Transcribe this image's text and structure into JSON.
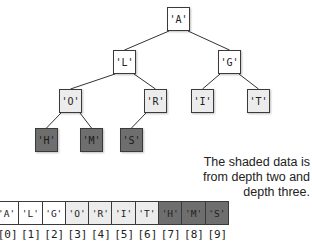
{
  "tree": {
    "nodes": [
      {
        "id": "A",
        "label": "'A'",
        "depth": 0,
        "shade": "light",
        "x": 167,
        "y": 7
      },
      {
        "id": "L",
        "label": "'L'",
        "depth": 1,
        "shade": "light",
        "x": 113,
        "y": 50
      },
      {
        "id": "G",
        "label": "'G'",
        "depth": 1,
        "shade": "light",
        "x": 218,
        "y": 50
      },
      {
        "id": "O",
        "label": "'O'",
        "depth": 2,
        "shade": "mid",
        "x": 59,
        "y": 89
      },
      {
        "id": "R",
        "label": "'R'",
        "depth": 2,
        "shade": "mid",
        "x": 144,
        "y": 89
      },
      {
        "id": "I",
        "label": "'I'",
        "depth": 2,
        "shade": "mid",
        "x": 191,
        "y": 89
      },
      {
        "id": "T",
        "label": "'T'",
        "depth": 2,
        "shade": "mid",
        "x": 247,
        "y": 89
      },
      {
        "id": "H",
        "label": "'H'",
        "depth": 3,
        "shade": "dark",
        "x": 35,
        "y": 128
      },
      {
        "id": "M",
        "label": "'M'",
        "depth": 3,
        "shade": "dark",
        "x": 80,
        "y": 128
      },
      {
        "id": "S",
        "label": "'S'",
        "depth": 3,
        "shade": "dark",
        "x": 120,
        "y": 128
      }
    ],
    "edges": [
      [
        "A",
        "L"
      ],
      [
        "A",
        "G"
      ],
      [
        "L",
        "O"
      ],
      [
        "L",
        "R"
      ],
      [
        "G",
        "I"
      ],
      [
        "G",
        "T"
      ],
      [
        "O",
        "H"
      ],
      [
        "O",
        "M"
      ],
      [
        "R",
        "S"
      ]
    ]
  },
  "note": {
    "text": "The shaded data is from depth two and depth three.",
    "line1": "The shaded data is",
    "line2": "from depth two and",
    "line3": "depth three."
  },
  "array": {
    "cells": [
      {
        "label": "'A'",
        "shade": "light"
      },
      {
        "label": "'L'",
        "shade": "light"
      },
      {
        "label": "'G'",
        "shade": "light"
      },
      {
        "label": "'O'",
        "shade": "mid"
      },
      {
        "label": "'R'",
        "shade": "mid"
      },
      {
        "label": "'I'",
        "shade": "mid"
      },
      {
        "label": "'T'",
        "shade": "mid"
      },
      {
        "label": "'H'",
        "shade": "dark"
      },
      {
        "label": "'M'",
        "shade": "dark"
      },
      {
        "label": "'S'",
        "shade": "dark"
      }
    ],
    "indices": [
      "[0]",
      "[1]",
      "[2]",
      "[3]",
      "[4]",
      "[5]",
      "[6]",
      "[7]",
      "[8]",
      "[9]"
    ]
  },
  "colors": {
    "light": "#ffffff",
    "mid": "#ececec",
    "dark": "#6e6e6e",
    "border": "#3a3a3a"
  }
}
